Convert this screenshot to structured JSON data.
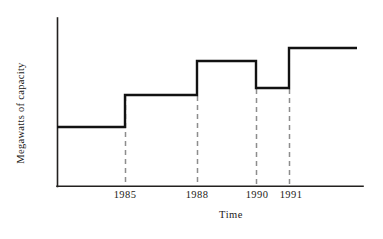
{
  "chart_data": {
    "type": "line",
    "subtype": "step",
    "title": "",
    "xlabel": "Time",
    "ylabel": "Megawatts of capacity",
    "grid": false,
    "legend": null,
    "x_tick_labels": [
      "1985",
      "1988",
      "1990",
      "1991"
    ],
    "y_tick_labels": [],
    "axis_note": "y-axis is unlabeled (no numeric scale shown); values below are relative capacity read off step heights",
    "xlim": [
      "before 1985",
      "after 1991"
    ],
    "ylim": [
      0,
      100
    ],
    "steps": [
      {
        "from_label": "start",
        "to_label": "1985",
        "value": 35,
        "x_start_px": 57,
        "x_end_px": 125,
        "y_px": 127
      },
      {
        "from_label": "1985",
        "to_label": "1988",
        "value": 55,
        "x_start_px": 125,
        "x_end_px": 197,
        "y_px": 95
      },
      {
        "from_label": "1988",
        "to_label": "1990",
        "value": 76,
        "x_start_px": 197,
        "x_end_px": 256,
        "y_px": 61
      },
      {
        "from_label": "1990",
        "to_label": "1991",
        "value": 60,
        "x_start_px": 256,
        "x_end_px": 289,
        "y_px": 88
      },
      {
        "from_label": "1991",
        "to_label": "end",
        "value": 85,
        "x_start_px": 289,
        "x_end_px": 357,
        "y_px": 48
      }
    ],
    "x": [
      "start",
      "1985",
      "1988",
      "1990",
      "1991",
      "end"
    ],
    "values": [
      35,
      55,
      76,
      60,
      85,
      85
    ],
    "annotations": [
      {
        "kind": "dropline",
        "at_label": "1985",
        "x_px": 125,
        "y_top_px": 95,
        "y_bottom_px": 186,
        "style": "dashed"
      },
      {
        "kind": "dropline",
        "at_label": "1988",
        "x_px": 197,
        "y_top_px": 95,
        "y_bottom_px": 186,
        "style": "dashed"
      },
      {
        "kind": "dropline",
        "at_label": "1990",
        "x_px": 256,
        "y_top_px": 88,
        "y_bottom_px": 186,
        "style": "dashed"
      },
      {
        "kind": "dropline",
        "at_label": "1991",
        "x_px": 289,
        "y_top_px": 88,
        "y_bottom_px": 186,
        "style": "dashed"
      }
    ],
    "colors": {
      "background": "#ffffff",
      "step_line": "#121212",
      "axis": "#23211f",
      "dropline": "#8d8d8d",
      "text": "#1c1a18"
    }
  },
  "axes": {
    "y_axis_title": "Megawatts of capacity",
    "x_axis_title": "Time"
  },
  "ticks": {
    "t0": "1985",
    "t1": "1988",
    "t2": "1990",
    "t3": "1991"
  }
}
